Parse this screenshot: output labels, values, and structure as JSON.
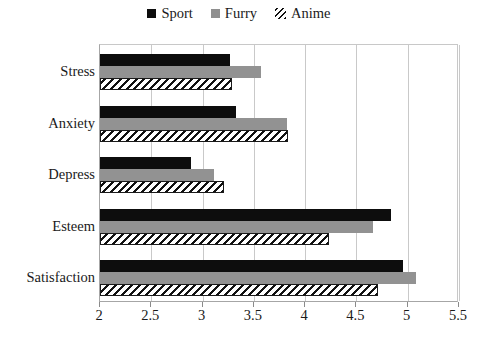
{
  "chart_data": {
    "type": "bar",
    "orientation": "horizontal",
    "title": "",
    "subtitle": "",
    "xlabel": "",
    "ylabel": "",
    "categories": [
      "Stress",
      "Anxiety",
      "Depress",
      "Esteem",
      "Satisfaction"
    ],
    "series": [
      {
        "name": "Sport",
        "color": "#0d0d0d",
        "pattern": "solid",
        "values": [
          3.27,
          3.33,
          2.89,
          4.84,
          4.95
        ]
      },
      {
        "name": "Furry",
        "color": "#929292",
        "pattern": "solid",
        "values": [
          3.57,
          3.82,
          3.11,
          4.66,
          5.08
        ]
      },
      {
        "name": "Anime",
        "color": "#ffffff",
        "pattern": "diagonal-hatch",
        "values": [
          3.29,
          3.83,
          3.21,
          4.23,
          4.71
        ]
      }
    ],
    "xlim": [
      2,
      5.5
    ],
    "xticks": [
      2,
      2.5,
      3,
      3.5,
      4,
      4.5,
      5,
      5.5
    ],
    "xtick_labels": [
      "2",
      "2.5",
      "3",
      "3.5",
      "4",
      "4.5",
      "5",
      "5.5"
    ],
    "grid": "vertical",
    "legend_position": "top-center",
    "legend": [
      "Sport",
      "Furry",
      "Anime"
    ]
  },
  "legend": {
    "items": [
      {
        "label": "Sport",
        "icon": "filled-square-black-icon"
      },
      {
        "label": "Furry",
        "icon": "filled-square-gray-icon"
      },
      {
        "label": "Anime",
        "icon": "hatched-square-icon"
      }
    ]
  },
  "axes": {
    "y_categories": [
      "Stress",
      "Anxiety",
      "Depress",
      "Esteem",
      "Satisfaction"
    ],
    "x_tick_labels": [
      "2",
      "2.5",
      "3",
      "3.5",
      "4",
      "4.5",
      "5",
      "5.5"
    ]
  }
}
